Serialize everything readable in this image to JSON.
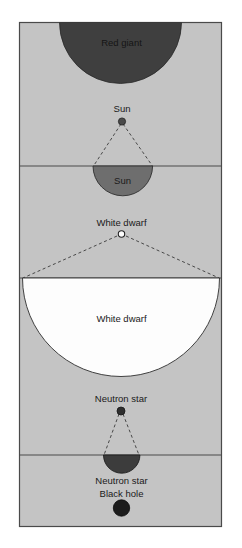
{
  "figure": {
    "background_color": "#ffffff",
    "panel_color": "#c4c4c4",
    "panel_border_color": "#4a4a4a",
    "leader_line_color": "#3a3a3a"
  },
  "objects": {
    "red_giant": {
      "label_small": "",
      "label_large": "Red giant",
      "color": "#3f3f3f"
    },
    "sun": {
      "label_small": "Sun",
      "label_large": "Sun",
      "color": "#6e6e6e"
    },
    "white_dwarf": {
      "label_small": "White dwarf",
      "label_large": "White dwarf",
      "color": "#fdfdfd"
    },
    "neutron_star": {
      "label_small": "Neutron star",
      "label_large": "Neutron star",
      "color": "#3c3c3c"
    },
    "black_hole": {
      "label_small": "Black hole",
      "label_large": "",
      "color": "#1c1c1c"
    }
  }
}
